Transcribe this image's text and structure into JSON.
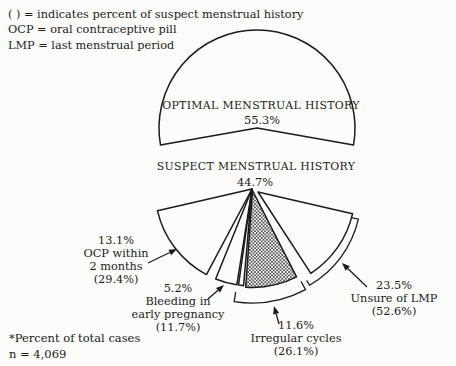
{
  "figure": {
    "legend": [
      "( ) = indicates percent of suspect menstrual history",
      "OCP = oral contraceptive pill",
      "LMP = last menstrual period"
    ],
    "footnote": {
      "line1": "*Percent of total cases",
      "line2": "n = 4,069"
    }
  },
  "chart_data": {
    "type": "pie",
    "n_total": 4069,
    "note": "Percent of total cases; parenthesized values are percent of suspect menstrual history",
    "optimal": {
      "label": "OPTIMAL MENSTRUAL HISTORY",
      "value_pct_total": 55.3,
      "pct_display": "55.3%"
    },
    "suspect": {
      "label": "SUSPECT MENSTRUAL HISTORY",
      "value_pct_total": 44.7,
      "pct_display": "44.7%"
    },
    "breakdown": [
      {
        "label": "OCP within 2 months",
        "pct_of_total": 13.1,
        "pct_of_suspect": 29.4
      },
      {
        "label": "Bleeding in early pregnancy",
        "pct_of_total": 5.2,
        "pct_of_suspect": 11.7
      },
      {
        "label": "Irregular cycles",
        "pct_of_total": 11.6,
        "pct_of_suspect": 26.1
      },
      {
        "label": "Unsure of LMP",
        "pct_of_total": 23.5,
        "pct_of_suspect": 52.6
      }
    ],
    "callouts": {
      "ocp": {
        "pct": "13.1%",
        "name1": "OCP within",
        "name2": "2 months",
        "suspect_pct": "(29.4%)"
      },
      "bleeding": {
        "pct": "5.2%",
        "name1": "Bleeding in",
        "name2": "early pregnancy",
        "suspect_pct": "(11.7%)"
      },
      "irregular": {
        "pct": "11.6%",
        "name1": "Irregular cycles",
        "suspect_pct": "(26.1%)"
      },
      "unsure": {
        "pct": "23.5%",
        "name1": "Unsure of LMP",
        "suspect_pct": "(52.6%)"
      }
    }
  }
}
